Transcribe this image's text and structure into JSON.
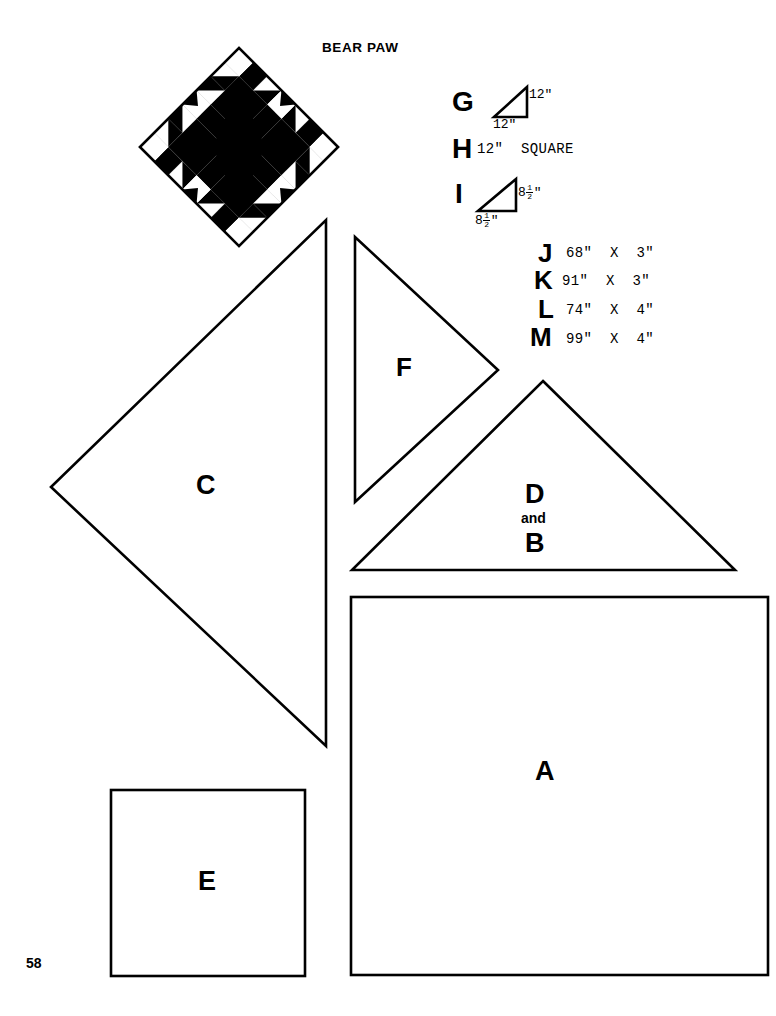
{
  "page": {
    "number": "58",
    "background_color": "#ffffff",
    "ink_color": "#000000"
  },
  "block": {
    "title": "BEAR PAW",
    "pattern_name": "bear-paw-quilt-block",
    "orientation": "diamond (rotated 45 degrees)",
    "fill_color": "#000000",
    "ground_color": "#ffffff"
  },
  "specs": [
    {
      "letter": "G",
      "shape": "right-triangle",
      "right_angle": "top-right",
      "side_label": "12\"",
      "base_label": "12\"",
      "text": ""
    },
    {
      "letter": "H",
      "shape": "none",
      "text": "12\"  SQUARE"
    },
    {
      "letter": "I",
      "shape": "right-triangle",
      "right_angle": "bottom-right",
      "side_label_whole": "8",
      "side_label_num": "1",
      "side_label_den": "2",
      "side_label_unit": "\"",
      "base_label_whole": "8",
      "base_label_num": "1",
      "base_label_den": "2",
      "base_label_unit": "\"",
      "text": ""
    }
  ],
  "strips": [
    {
      "letter": "J",
      "text": "68\"  X  3\""
    },
    {
      "letter": "K",
      "text": "91\"  X  3\""
    },
    {
      "letter": "L",
      "text": "74\"  X  4\""
    },
    {
      "letter": "M",
      "text": "99\"  X  4\""
    }
  ],
  "pieces": [
    {
      "id": "A",
      "label": "A",
      "shape": "square"
    },
    {
      "id": "C",
      "label": "C",
      "shape": "right-triangle"
    },
    {
      "id": "DB",
      "label_top": "D",
      "label_mid": "and",
      "label_bottom": "B",
      "shape": "triangle"
    },
    {
      "id": "E",
      "label": "E",
      "shape": "square"
    },
    {
      "id": "F",
      "label": "F",
      "shape": "triangle"
    }
  ]
}
